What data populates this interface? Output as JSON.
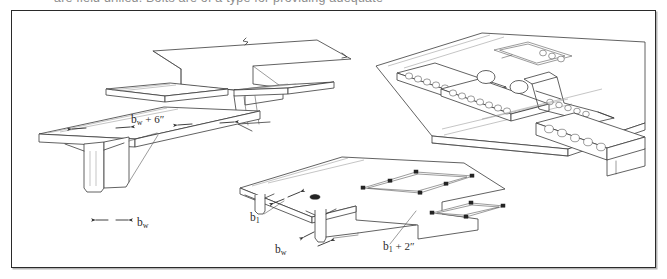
{
  "figure": {
    "caption_clipped": "are field drilled. Bolts are of a type for providing adequate",
    "frame_border_color": "#2a2a2a",
    "line_color": "#3a3a3a",
    "background": "#ffffff"
  },
  "labels": [
    {
      "id": "bw-plus-6",
      "text": "b",
      "sub": "w",
      "rest": " + 6″",
      "x": 130,
      "y": 110
    },
    {
      "id": "bw-left",
      "text": "b",
      "sub": "w",
      "rest": "",
      "x": 140,
      "y": 213
    },
    {
      "id": "b1-center",
      "text": "b",
      "sub": "1",
      "rest": "",
      "x": 250,
      "y": 208
    },
    {
      "id": "bw-center",
      "text": "b",
      "sub": "w",
      "rest": "",
      "x": 276,
      "y": 243
    },
    {
      "id": "b1-plus-2",
      "text": "b",
      "sub": "1",
      "rest": " + 2″",
      "x": 385,
      "y": 240
    }
  ],
  "views": [
    {
      "id": "view-upper-left",
      "name": "stepped-deck-panel-isometric",
      "description": "Isometric of a precast deck panel with a stepped / notched edge and turned-down ledge"
    },
    {
      "id": "view-lower-left",
      "name": "tee-beam-cross-section",
      "description": "Precast tee beam with deck flange and single stem web"
    },
    {
      "id": "view-center",
      "name": "deck-panel-on-tee-beams-isometric",
      "description": "Deck panel seated on two tee beam stems with rectangular shear pocket blockouts"
    },
    {
      "id": "view-right",
      "name": "deck-with-shear-connector-pockets-isometric",
      "description": "Bridge deck slab over girder showing rows of circular shear stud pockets and rectangular blockouts"
    }
  ],
  "dimension_symbols": {
    "bw": "web width",
    "b1": "bearing width",
    "plus_6_in": "6″",
    "plus_2_in": "2″"
  }
}
